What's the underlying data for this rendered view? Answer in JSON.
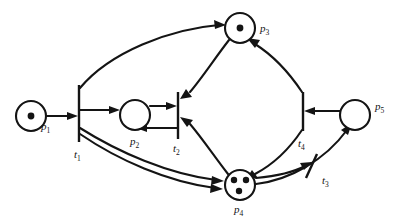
{
  "diagram": {
    "type": "petri-net",
    "colors": {
      "stroke": "#141414",
      "fill": "#ffffff",
      "background": "#ffffff"
    },
    "places": [
      {
        "id": "p1",
        "label": "p",
        "subscript": "1",
        "tokens": 1,
        "cx": 31,
        "cy": 116,
        "r": 15
      },
      {
        "id": "p2",
        "label": "p",
        "subscript": "2",
        "tokens": 0,
        "cx": 135,
        "cy": 115,
        "r": 15
      },
      {
        "id": "p3",
        "label": "p",
        "subscript": "3",
        "tokens": 1,
        "cx": 240,
        "cy": 28,
        "r": 15
      },
      {
        "id": "p4",
        "label": "p",
        "subscript": "4",
        "tokens": 3,
        "cx": 240,
        "cy": 185,
        "r": 15
      },
      {
        "id": "p5",
        "label": "p",
        "subscript": "5",
        "tokens": 0,
        "cx": 355,
        "cy": 115,
        "r": 15
      }
    ],
    "transitions": [
      {
        "id": "t1",
        "label": "t",
        "subscript": "1",
        "x": 79,
        "y1": 85,
        "y2": 142,
        "rotation": 0
      },
      {
        "id": "t2",
        "label": "t",
        "subscript": "2",
        "x": 178,
        "y1": 92,
        "y2": 139,
        "rotation": 0
      },
      {
        "id": "t3",
        "label": "t",
        "subscript": "3",
        "x": 310,
        "y1": 160,
        "y2": 186,
        "rotation": 26
      },
      {
        "id": "t4",
        "label": "t",
        "subscript": "4",
        "x": 303,
        "y1": 92,
        "y2": 131,
        "rotation": 0
      }
    ],
    "arcs": [
      {
        "from": "p1",
        "to": "t1",
        "shape": "straight"
      },
      {
        "from": "t1",
        "to": "p2",
        "shape": "straight"
      },
      {
        "from": "t1",
        "to": "p3",
        "shape": "curve-top"
      },
      {
        "from": "t1",
        "to": "p4",
        "shape": "curve-bottom-outer"
      },
      {
        "from": "t1",
        "to": "p4",
        "shape": "curve-bottom-inner"
      },
      {
        "from": "p2",
        "to": "t2",
        "shape": "straight"
      },
      {
        "from": "t2",
        "to": "p2",
        "shape": "straight-return"
      },
      {
        "from": "p3",
        "to": "t2",
        "shape": "curve"
      },
      {
        "from": "p4",
        "to": "t2",
        "shape": "curve"
      },
      {
        "from": "t4",
        "to": "p3",
        "shape": "curve"
      },
      {
        "from": "t4",
        "to": "p4",
        "shape": "curve"
      },
      {
        "from": "p5",
        "to": "t4",
        "shape": "straight"
      },
      {
        "from": "p4",
        "to": "p5",
        "shape": "curve-through-t3-outer"
      },
      {
        "from": "p4",
        "to": "p5",
        "shape": "curve-through-t3-inner"
      }
    ]
  }
}
